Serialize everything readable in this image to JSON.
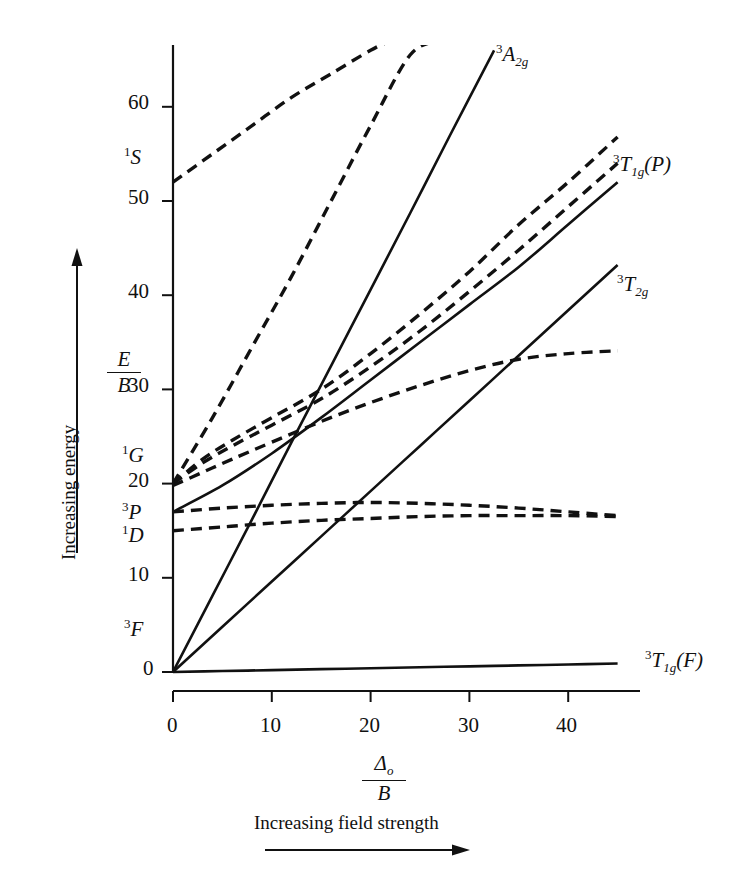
{
  "figure": {
    "kind": "tanabe-sugano-diagram",
    "axes": {
      "y_label_numerator": "E",
      "y_label_denominator": "B",
      "y_ticks": [
        {
          "value": 0,
          "label": "0"
        },
        {
          "value": 10,
          "label": "10"
        },
        {
          "value": 20,
          "label": "20"
        },
        {
          "value": 30,
          "label": "30"
        },
        {
          "value": 40,
          "label": "40"
        },
        {
          "value": 50,
          "label": "50"
        },
        {
          "value": 60,
          "label": "60"
        }
      ],
      "x_label_numerator": "Δ",
      "x_label_numerator_sub": "o",
      "x_label_denominator": "B",
      "x_ticks": [
        {
          "value": 0,
          "label": "0"
        },
        {
          "value": 10,
          "label": "10"
        },
        {
          "value": 20,
          "label": "20"
        },
        {
          "value": 30,
          "label": "30"
        },
        {
          "value": 40,
          "label": "40"
        }
      ],
      "y_caption": "Increasing energy",
      "x_caption": "Increasing field strength"
    },
    "free_ion_terms": [
      {
        "name": "1S",
        "sup": "1",
        "letter": "S",
        "energy": 52
      },
      {
        "name": "1G",
        "sup": "1",
        "letter": "G",
        "energy": 20
      },
      {
        "name": "3P",
        "sup": "3",
        "letter": "P",
        "energy": 17
      },
      {
        "name": "1D",
        "sup": "1",
        "letter": "D",
        "energy": 15
      },
      {
        "name": "3F",
        "sup": "3",
        "letter": "F",
        "energy": 0
      }
    ],
    "state_labels": [
      {
        "name": "3A2g",
        "sup": "3",
        "letter": "A",
        "sub": "2g",
        "paren": ""
      },
      {
        "name": "3T1g(P)",
        "sup": "3",
        "letter": "T",
        "sub": "1g",
        "paren": "(P)"
      },
      {
        "name": "3T2g",
        "sup": "3",
        "letter": "T",
        "sub": "2g",
        "paren": ""
      },
      {
        "name": "3T1g(F)",
        "sup": "3",
        "letter": "T",
        "sub": "1g",
        "paren": "(F)"
      }
    ]
  },
  "chart_data": {
    "type": "line",
    "title": "",
    "xlabel": "Δo/B",
    "ylabel": "E/B",
    "xlim": [
      0,
      45
    ],
    "ylim": [
      0,
      67
    ],
    "grid": false,
    "legend": "inline-right-labels",
    "series": [
      {
        "name": "3T1g(F)",
        "style": "solid",
        "label": "3T1g (F)",
        "label_at": [
          45,
          0.6
        ],
        "points": [
          [
            0,
            0
          ],
          [
            5,
            0.1
          ],
          [
            10,
            0.2
          ],
          [
            15,
            0.3
          ],
          [
            20,
            0.4
          ],
          [
            25,
            0.5
          ],
          [
            30,
            0.6
          ],
          [
            35,
            0.7
          ],
          [
            40,
            0.8
          ],
          [
            45,
            0.9
          ]
        ]
      },
      {
        "name": "3T2g",
        "style": "solid",
        "label": "3T2g",
        "label_at": [
          45,
          43
        ],
        "points": [
          [
            0,
            0
          ],
          [
            5,
            4.8
          ],
          [
            10,
            9.6
          ],
          [
            15,
            14.4
          ],
          [
            20,
            19.2
          ],
          [
            25,
            24
          ],
          [
            30,
            28.8
          ],
          [
            35,
            33.6
          ],
          [
            40,
            38.4
          ],
          [
            45,
            43.2
          ]
        ]
      },
      {
        "name": "3A2g",
        "style": "solid",
        "label": "3A2g",
        "label_at": [
          32.5,
          66
        ],
        "points": [
          [
            0,
            0
          ],
          [
            4,
            8.1
          ],
          [
            8,
            16.2
          ],
          [
            12,
            24.4
          ],
          [
            16,
            32.5
          ],
          [
            20,
            40.6
          ],
          [
            24,
            48.7
          ],
          [
            28,
            56.9
          ],
          [
            32.5,
            66
          ]
        ]
      },
      {
        "name": "3T1g(P)",
        "style": "solid",
        "label": "3T1g (P)",
        "label_at": [
          45,
          52
        ],
        "points": [
          [
            0,
            17
          ],
          [
            5,
            19.8
          ],
          [
            10,
            23.2
          ],
          [
            15,
            27
          ],
          [
            20,
            31
          ],
          [
            25,
            35
          ],
          [
            30,
            39
          ],
          [
            35,
            43
          ],
          [
            40,
            47.5
          ],
          [
            45,
            52
          ]
        ]
      },
      {
        "name": "1S-derived",
        "style": "dashed",
        "points": [
          [
            0,
            52
          ],
          [
            4,
            55
          ],
          [
            8,
            58
          ],
          [
            12,
            61
          ],
          [
            16,
            63.5
          ],
          [
            20,
            66
          ],
          [
            22,
            67
          ]
        ]
      },
      {
        "name": "1A1g-steep",
        "style": "dashed",
        "points": [
          [
            0,
            20
          ],
          [
            4,
            27
          ],
          [
            8,
            34.5
          ],
          [
            12,
            42
          ],
          [
            16,
            50
          ],
          [
            20,
            58
          ],
          [
            24,
            65.5
          ],
          [
            27,
            67
          ]
        ]
      },
      {
        "name": "1T2g-upper",
        "style": "dashed",
        "points": [
          [
            0,
            20
          ],
          [
            3,
            22.6
          ],
          [
            6,
            24.6
          ],
          [
            10,
            27
          ],
          [
            15,
            30
          ],
          [
            20,
            33.8
          ],
          [
            25,
            38
          ],
          [
            30,
            42.5
          ],
          [
            35,
            47.5
          ],
          [
            40,
            52
          ],
          [
            45,
            56.8
          ]
        ]
      },
      {
        "name": "1Eg-upper",
        "style": "dashed",
        "points": [
          [
            0,
            20
          ],
          [
            3,
            22.2
          ],
          [
            6,
            24
          ],
          [
            10,
            26.2
          ],
          [
            15,
            29
          ],
          [
            20,
            32.4
          ],
          [
            25,
            36.2
          ],
          [
            30,
            40.4
          ],
          [
            35,
            44.8
          ],
          [
            40,
            49.4
          ],
          [
            45,
            54
          ]
        ]
      },
      {
        "name": "1T2g-lower",
        "style": "dashed",
        "points": [
          [
            0,
            19.8
          ],
          [
            3,
            21.2
          ],
          [
            6,
            22.6
          ],
          [
            10,
            24.4
          ],
          [
            15,
            26.6
          ],
          [
            20,
            28.6
          ],
          [
            25,
            30.4
          ],
          [
            30,
            32
          ],
          [
            35,
            33.2
          ],
          [
            40,
            33.8
          ],
          [
            45,
            34.1
          ]
        ]
      },
      {
        "name": "1T2g-from-D",
        "style": "dashed",
        "points": [
          [
            0,
            17
          ],
          [
            5,
            17.4
          ],
          [
            10,
            17.7
          ],
          [
            15,
            17.9
          ],
          [
            20,
            18
          ],
          [
            25,
            17.9
          ],
          [
            30,
            17.7
          ],
          [
            35,
            17.4
          ],
          [
            40,
            17
          ],
          [
            45,
            16.6
          ]
        ]
      },
      {
        "name": "1Eg-from-D",
        "style": "dashed",
        "points": [
          [
            0,
            15
          ],
          [
            5,
            15.4
          ],
          [
            10,
            15.8
          ],
          [
            15,
            16.1
          ],
          [
            20,
            16.3
          ],
          [
            25,
            16.5
          ],
          [
            30,
            16.6
          ],
          [
            35,
            16.6
          ],
          [
            40,
            16.6
          ],
          [
            45,
            16.5
          ]
        ]
      }
    ]
  }
}
